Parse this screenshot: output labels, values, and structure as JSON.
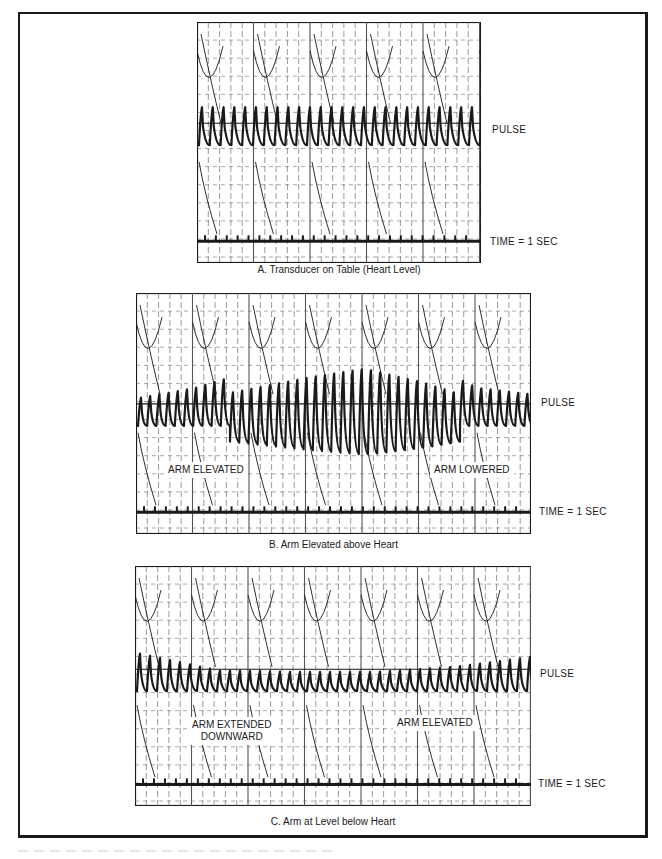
{
  "figure": {
    "panels": [
      {
        "id": "A",
        "caption": "A.  Transducer on Table (Heart Level)",
        "pulse_label": "PULSE",
        "time_label": "TIME  =  1 SEC",
        "annotations": []
      },
      {
        "id": "B",
        "caption": "B.  Arm Elevated above Heart",
        "pulse_label": "PULSE",
        "time_label": "TIME  =  1 SEC",
        "annotations": [
          "ARM ELEVATED",
          "ARM LOWERED"
        ]
      },
      {
        "id": "C",
        "caption": "C.  Arm at Level below Heart",
        "pulse_label": "PULSE",
        "time_label": "TIME  =  1 SEC",
        "annotations": [
          "ARM EXTENDED\nDOWNWARD",
          "ARM ELEVATED"
        ]
      }
    ],
    "colors": {
      "ink": "#1a1a1a",
      "grid": "#555555",
      "paper": "#ffffff"
    }
  },
  "chart_data": [
    {
      "type": "line",
      "title": "A. Transducer on Table (Heart Level)",
      "series": [
        {
          "name": "PULSE",
          "description": "steady pulse waveform, ~26 beats across trace, roughly constant amplitude",
          "relative_amplitude": [
            1.0,
            1.0,
            1.0,
            1.0,
            1.0
          ]
        },
        {
          "name": "TIME = 1 SEC",
          "description": "timing marker line with tick each second",
          "tick_count": 25
        }
      ],
      "xlabel": "",
      "ylabel": "",
      "grid": true
    },
    {
      "type": "line",
      "title": "B. Arm Elevated above Heart",
      "series": [
        {
          "name": "PULSE",
          "description": "pulse amplitude grows when arm elevated, peaks mid-trace, decreases after arm lowered",
          "relative_amplitude": [
            0.7,
            1.0,
            1.5,
            2.0,
            2.4,
            1.8,
            1.0,
            0.8
          ]
        },
        {
          "name": "TIME = 1 SEC",
          "tick_count": 35
        }
      ],
      "annotations": [
        "ARM ELEVATED",
        "ARM LOWERED"
      ],
      "grid": true
    },
    {
      "type": "line",
      "title": "C. Arm at Level below Heart",
      "series": [
        {
          "name": "PULSE",
          "description": "pulse amplitude reduced while arm extended downward, returns when arm elevated",
          "relative_amplitude": [
            1.0,
            0.5,
            0.45,
            0.45,
            0.6,
            0.9
          ]
        },
        {
          "name": "TIME = 1 SEC",
          "tick_count": 35
        }
      ],
      "annotations": [
        "ARM EXTENDED DOWNWARD",
        "ARM ELEVATED"
      ],
      "grid": true
    }
  ]
}
